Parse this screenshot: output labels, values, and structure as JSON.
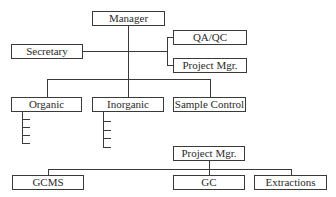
{
  "diagram": {
    "type": "org-chart",
    "top": {
      "root": "Manager",
      "staff_left": "Secretary",
      "staff_right": [
        "QA/QC",
        "Project Mgr."
      ],
      "departments": [
        "Organic",
        "Inorganic",
        "Sample Control"
      ]
    },
    "bottom": {
      "root": "Project Mgr.",
      "children": [
        "GCMS",
        "GC",
        "Extractions"
      ]
    }
  }
}
